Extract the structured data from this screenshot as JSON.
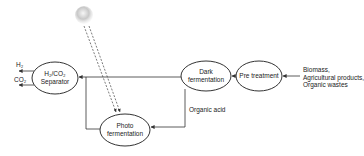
{
  "diagram": {
    "type": "process-flow",
    "title": "",
    "nodes": [
      {
        "id": "separator",
        "line1": "H₂/CO₂",
        "line2": "Separator"
      },
      {
        "id": "dark",
        "line1": "Dark",
        "line2": "fermentation"
      },
      {
        "id": "pretreatment",
        "line1": "Pre treatment"
      },
      {
        "id": "photo",
        "line1": "Photo",
        "line2": "fermentation"
      }
    ],
    "outputs": {
      "h2": "H₂",
      "co2": "CO₂"
    },
    "inputs": {
      "line1": "Biomass,",
      "line2": "Agricultural products,",
      "line3": "Organic wastes"
    },
    "edge_labels": {
      "organic_acid": "Organic acid"
    },
    "edges": [
      {
        "from": "inputs",
        "to": "pretreatment"
      },
      {
        "from": "pretreatment",
        "to": "dark"
      },
      {
        "from": "dark",
        "to": "separator"
      },
      {
        "from": "dark",
        "to": "photo",
        "label": "Organic acid"
      },
      {
        "from": "photo",
        "to": "separator"
      },
      {
        "from": "sun",
        "to": "photo",
        "style": "dashed"
      },
      {
        "from": "separator",
        "to": "h2"
      },
      {
        "from": "separator",
        "to": "co2"
      }
    ],
    "colors": {
      "stroke": "#333333",
      "text": "#222222",
      "sun": "#bfbfbf"
    }
  }
}
